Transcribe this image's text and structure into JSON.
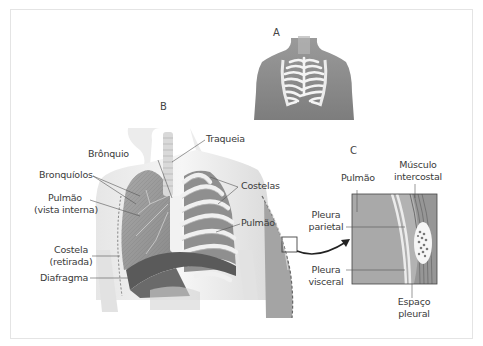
{
  "panels": {
    "a": "A",
    "b": "B",
    "c": "C"
  },
  "labels_b": {
    "traqueia": "Traqueia",
    "bronquio": "Brônquio",
    "bronquiolos": "Bronquíolos",
    "pulmao_interna_1": "Pulmão",
    "pulmao_interna_2": "(vista interna)",
    "costelas": "Costelas",
    "pulmao": "Pulmão",
    "costela_retirada_1": "Costela",
    "costela_retirada_2": "(retirada)",
    "diafragma": "Diafragma"
  },
  "labels_c": {
    "pulmao": "Pulmão",
    "musculo_1": "Músculo",
    "musculo_2": "intercostal",
    "pleura_parietal_1": "Pleura",
    "pleura_parietal_2": "parietal",
    "pleura_visceral_1": "Pleura",
    "pleura_visceral_2": "visceral",
    "espaco_1": "Espaço",
    "espaco_2": "pleural"
  },
  "colors": {
    "skin": "#8a8a8a",
    "bone": "#f2f2f2",
    "lung": "#9a9a9a",
    "diaphragm": "#505050",
    "leader": "#555555"
  }
}
